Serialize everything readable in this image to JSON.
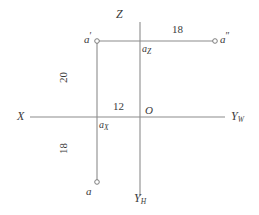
{
  "diagram": {
    "stroke_color": "#8c8c8c",
    "text_color": "#3a3a3a",
    "axes": [
      {
        "id": "x-axis",
        "label": "X"
      },
      {
        "id": "yw-axis",
        "label": "Y",
        "subscript": "W"
      },
      {
        "id": "z-axis",
        "label": "Z"
      },
      {
        "id": "yh-axis",
        "label": "Y",
        "subscript": "H"
      }
    ],
    "origin": {
      "label": "O"
    },
    "points": [
      {
        "id": "a-prime",
        "label": "a",
        "mark": "′",
        "x": 97,
        "y": 41
      },
      {
        "id": "a-double-prime",
        "label": "a",
        "mark": "″",
        "x": 215,
        "y": 41
      },
      {
        "id": "a-plain",
        "label": "a",
        "mark": "",
        "x": 97,
        "y": 182
      }
    ],
    "axis_feet": [
      {
        "id": "a-z",
        "label": "a",
        "subscript": "Z"
      },
      {
        "id": "a-x",
        "label": "a",
        "subscript": "X"
      }
    ],
    "dimensions": [
      {
        "id": "dim-18-top",
        "value": "18",
        "orientation": "horizontal"
      },
      {
        "id": "dim-20-left",
        "value": "20",
        "orientation": "vertical"
      },
      {
        "id": "dim-12-center",
        "value": "12",
        "orientation": "horizontal"
      },
      {
        "id": "dim-18-bottom",
        "value": "18",
        "orientation": "vertical"
      }
    ]
  }
}
